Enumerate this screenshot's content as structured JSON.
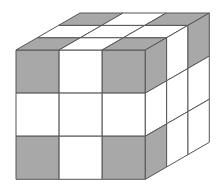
{
  "figure": {
    "colors": {
      "gray": "#a8a8a8",
      "white": "#ffffff",
      "edge": "#555555"
    },
    "geometry": {
      "front_origin": [
        16,
        50
      ],
      "cell_size": 43.1,
      "depth_vector": [
        21.33,
        -12.33
      ]
    },
    "faces": {
      "front": [
        [
          "gray",
          "white",
          "gray"
        ],
        [
          "white",
          "white",
          "white"
        ],
        [
          "gray",
          "white",
          "gray"
        ]
      ],
      "top": [
        [
          "gray",
          "white",
          "gray"
        ],
        [
          "white",
          "white",
          "white"
        ],
        [
          "gray",
          "white",
          "gray"
        ]
      ],
      "right": [
        [
          "gray",
          "white",
          "gray"
        ],
        [
          "white",
          "white",
          "white"
        ],
        [
          "gray",
          "white",
          "white"
        ]
      ]
    }
  }
}
